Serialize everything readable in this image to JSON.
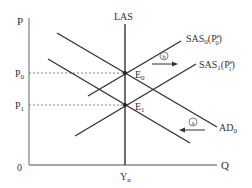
{
  "diagram": {
    "type": "AD-AS economics diagram",
    "axes": {
      "y_label": "P",
      "x_label": "Q",
      "origin_label": "0"
    },
    "price_levels": [
      {
        "label": "P",
        "sub": "0"
      },
      {
        "label": "P",
        "sub": "1"
      }
    ],
    "output_label": {
      "label": "Y",
      "sub": "n"
    },
    "curves": {
      "las": "LAS",
      "sas0": {
        "main": "SAS",
        "sub": "0",
        "paren": "(P",
        "paren_sup": "e",
        "paren_sub": "0",
        "close": ")"
      },
      "sas1": {
        "main": "SAS",
        "sub": "1",
        "paren": "(P",
        "paren_sup": "e",
        "paren_sub": "1",
        "close": ")"
      },
      "ad0": {
        "main": "AD",
        "sub": "0"
      }
    },
    "equilibria": [
      {
        "label": "E",
        "sub": "0"
      },
      {
        "label": "E",
        "sub": "1"
      }
    ],
    "shift_markers": {
      "a": "a",
      "b": "b"
    },
    "colors": {
      "line": "#333333",
      "axis": "#888888",
      "dashed": "#666666"
    }
  }
}
